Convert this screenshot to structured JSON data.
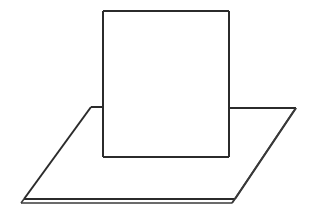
{
  "figure": {
    "type": "line-drawing",
    "canvas": {
      "width": 313,
      "height": 218,
      "background": "#ffffff"
    },
    "stroke": {
      "color": "#2b2b2b",
      "thin_color": "#3a3a3a",
      "width_main": 2.0,
      "width_thin": 1.4
    }
  },
  "shapes": {
    "ground_slab": {
      "name": "horizontal-plane",
      "description": "Thin planar slab drawn in oblique projection, showing top face and two visible side faces",
      "top_face": {
        "back_left": [
          91,
          107
        ],
        "back_right": [
          296,
          108
        ],
        "front_right": [
          235,
          199
        ],
        "front_left": [
          24,
          199
        ]
      },
      "thickness_offset": [
        -3,
        4
      ],
      "right_side_face": {
        "top_back": [
          296,
          108
        ],
        "top_front": [
          235,
          199
        ],
        "bottom_front": [
          232,
          203
        ],
        "bottom_back": [
          293,
          112
        ]
      },
      "front_side_face": {
        "top_left": [
          24,
          199
        ],
        "top_right": [
          235,
          199
        ],
        "bottom_right": [
          232,
          203
        ],
        "bottom_left": [
          21,
          203
        ]
      },
      "occluded_back_edge": {
        "visible_left_segment": [
          [
            91,
            107
          ],
          [
            103,
            107
          ]
        ],
        "hidden_segment": [
          [
            103,
            107
          ],
          [
            229,
            108
          ]
        ],
        "visible_right_segment": [
          [
            229,
            108
          ],
          [
            296,
            108
          ]
        ]
      }
    },
    "panel": {
      "name": "vertical-rectangle",
      "description": "Upright rectangular panel standing on the plane, occluding part of the back edge",
      "top_left": [
        103,
        11
      ],
      "top_right": [
        229,
        11
      ],
      "bottom_right": [
        229,
        157
      ],
      "bottom_left": [
        103,
        157
      ],
      "width": 126,
      "height": 146
    }
  },
  "labels": {
    "panel_label": "",
    "plane_label": "",
    "caption": ""
  }
}
